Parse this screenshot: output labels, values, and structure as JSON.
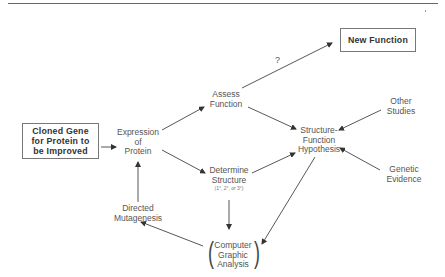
{
  "diagram": {
    "nodes": {
      "cloned_gene": {
        "lines": [
          "Cloned Gene",
          "for Protein to",
          "be Improved"
        ],
        "boxed": true
      },
      "expression": {
        "lines": [
          "Expression",
          "of",
          "Protein"
        ]
      },
      "assess_function": {
        "lines": [
          "Assess",
          "Function"
        ]
      },
      "determine_structure": {
        "lines": [
          "Determine",
          "Structure"
        ],
        "note": "(1°, 2°, or 3°)"
      },
      "new_function": {
        "label": "New Function",
        "boxed": true
      },
      "hypothesis": {
        "lines": [
          "Structure-",
          "Function",
          "Hypothesis"
        ]
      },
      "other_studies": {
        "lines": [
          "Other",
          "Studies"
        ]
      },
      "genetic_evidence": {
        "lines": [
          "Genetic",
          "Evidence"
        ]
      },
      "computer_graphic": {
        "lines": [
          "Computer",
          "Graphic",
          "Analysis"
        ]
      },
      "directed_mutagenesis": {
        "lines": [
          "Directed",
          "Mutagenesis"
        ]
      }
    },
    "edge_labels": {
      "assess_to_new": "?"
    },
    "edges": [
      [
        "cloned_gene",
        "expression"
      ],
      [
        "expression",
        "assess_function"
      ],
      [
        "expression",
        "determine_structure"
      ],
      [
        "assess_function",
        "new_function"
      ],
      [
        "assess_function",
        "hypothesis"
      ],
      [
        "determine_structure",
        "hypothesis"
      ],
      [
        "determine_structure",
        "computer_graphic"
      ],
      [
        "other_studies",
        "hypothesis"
      ],
      [
        "genetic_evidence",
        "hypothesis"
      ],
      [
        "hypothesis",
        "computer_graphic"
      ],
      [
        "computer_graphic",
        "directed_mutagenesis"
      ],
      [
        "directed_mutagenesis",
        "expression"
      ]
    ]
  }
}
